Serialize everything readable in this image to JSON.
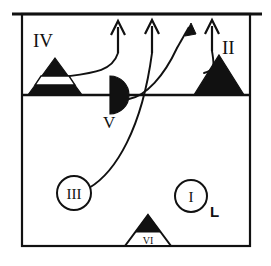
{
  "figure": {
    "background_color": "#ffffff",
    "ink_color": "#111111",
    "frame": {
      "name": "outer-frame",
      "x": 22,
      "y": 14,
      "width": 228,
      "height": 232,
      "stroke_width": 2.2
    },
    "top_rule": {
      "name": "top-rule",
      "x1": 12,
      "x2": 262,
      "y": 14,
      "stroke_width": 2.6
    },
    "divider": {
      "name": "horizontal-divider",
      "x1": 22,
      "x2": 250,
      "y": 95,
      "stroke_width": 2.4
    },
    "markers": [
      {
        "id": "IV",
        "label": "IV",
        "shape": "banded-triangle",
        "label_x": 33,
        "label_y": 47,
        "cx": 55,
        "base_y": 95,
        "half_width": 27,
        "apex_y": 58,
        "band_fill": "#ffffff",
        "fill": "#111111"
      },
      {
        "id": "II",
        "label": "II",
        "shape": "solid-triangle",
        "label_x": 222,
        "label_y": 54,
        "cx": 219,
        "base_y": 95,
        "half_width": 25,
        "apex_y": 55,
        "fill": "#111111"
      },
      {
        "id": "V",
        "label": "V",
        "shape": "half-disc",
        "label_x": 103,
        "label_y": 126,
        "cx": 110,
        "cy": 95,
        "radius": 19,
        "fill": "#111111"
      },
      {
        "id": "III",
        "label": "III",
        "shape": "circle-outline",
        "cx": 74,
        "cy": 193,
        "radius": 17,
        "fill": "#ffffff"
      },
      {
        "id": "I",
        "label": "I",
        "shape": "circle-outline",
        "cx": 191,
        "cy": 196,
        "radius": 16,
        "fill": "#ffffff"
      },
      {
        "id": "VI",
        "label": "VI",
        "shape": "half-filled-triangle",
        "cx": 148,
        "base_y": 246,
        "half_width": 23,
        "apex_y": 215,
        "fill": "#111111"
      }
    ],
    "extra_labels": [
      {
        "id": "L",
        "label": "L",
        "x": 213,
        "y": 215,
        "style": "bold-sans"
      }
    ],
    "arrows": [
      {
        "id": "arrow-1",
        "head": "open",
        "x": 118,
        "tip_y": 22,
        "tail_y": 52
      },
      {
        "id": "arrow-2",
        "head": "open",
        "x": 152,
        "tip_y": 21,
        "tail_y": 52
      },
      {
        "id": "arrow-3",
        "head": "solid",
        "tip_x": 191,
        "tip_y": 24,
        "tail_x": 176,
        "tail_y": 46
      },
      {
        "id": "arrow-4",
        "head": "open",
        "x": 212,
        "tip_y": 21,
        "tail_y": 50
      }
    ],
    "flow_paths": [
      {
        "id": "path-iv-to-arrow1",
        "from": "IV",
        "to": "arrow-1",
        "d": "M 62 77 C 92 73 112 72 118 53"
      },
      {
        "id": "path-iii-to-arrow2",
        "from": "III",
        "to": "arrow-2",
        "d": "M 89 188 C 116 172 142 128 152 53"
      },
      {
        "id": "path-v-to-arrow3",
        "from": "V",
        "to": "arrow-3",
        "d": "M 129 99 C 146 96 164 76 177 48"
      },
      {
        "id": "path-ii-to-arrow4",
        "from": "II",
        "to": "arrow-4",
        "d": "M 204 73 C 216 70 214 64 212 51"
      }
    ]
  }
}
